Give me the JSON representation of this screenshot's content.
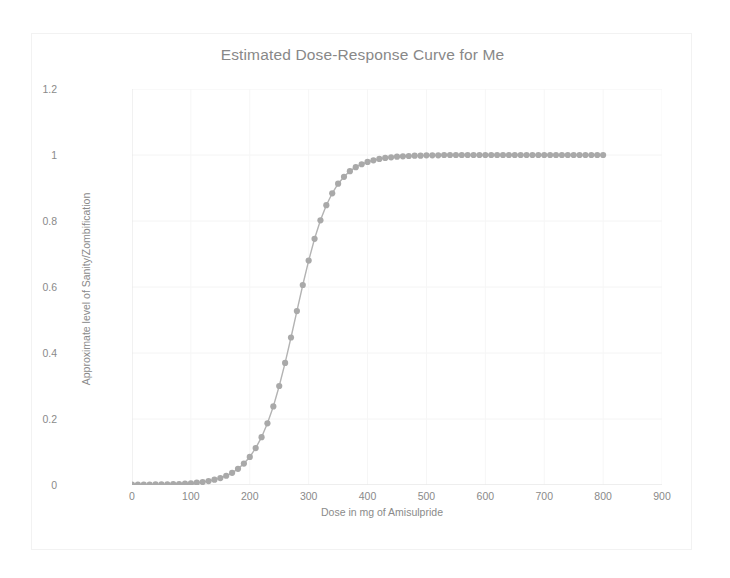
{
  "chart_data": {
    "type": "line",
    "title": "Estimated Dose-Response Curve for Me",
    "xlabel": "Dose in mg of Amisulpride",
    "ylabel": "Approximate level of Sanity/Zombification",
    "xlim": [
      0,
      900
    ],
    "ylim": [
      0,
      1.2
    ],
    "xticks": [
      0,
      100,
      200,
      300,
      400,
      500,
      600,
      700,
      800,
      900
    ],
    "yticks": [
      0,
      0.2,
      0.4,
      0.6,
      0.8,
      1,
      1.2
    ],
    "ytick_labels": [
      "0",
      "0.2",
      "0.4",
      "0.6",
      "0.8",
      "1",
      "1.2"
    ],
    "xtick_labels": [
      "0",
      "100",
      "200",
      "300",
      "400",
      "500",
      "600",
      "700",
      "800",
      "900"
    ],
    "grid": true,
    "legend": null,
    "marker": "circle",
    "series_color": "#a9a9a9",
    "line_color": "#b3b3b3",
    "series": [
      {
        "name": "Estimated dose-response",
        "x": [
          0,
          10,
          20,
          30,
          40,
          50,
          60,
          70,
          80,
          90,
          100,
          110,
          120,
          130,
          140,
          150,
          160,
          170,
          180,
          190,
          200,
          210,
          220,
          230,
          240,
          250,
          260,
          270,
          280,
          290,
          300,
          310,
          320,
          330,
          340,
          350,
          360,
          370,
          380,
          390,
          400,
          410,
          420,
          430,
          440,
          450,
          460,
          470,
          480,
          490,
          500,
          510,
          520,
          530,
          540,
          550,
          560,
          570,
          580,
          590,
          600,
          610,
          620,
          630,
          640,
          650,
          660,
          670,
          680,
          690,
          700,
          710,
          720,
          730,
          740,
          750,
          760,
          770,
          780,
          790,
          800
        ],
        "y": [
          0.001,
          0.001,
          0.001,
          0.001,
          0.002,
          0.002,
          0.002,
          0.003,
          0.003,
          0.004,
          0.005,
          0.007,
          0.009,
          0.012,
          0.016,
          0.021,
          0.028,
          0.037,
          0.049,
          0.065,
          0.085,
          0.112,
          0.145,
          0.187,
          0.238,
          0.3,
          0.37,
          0.447,
          0.527,
          0.606,
          0.68,
          0.746,
          0.802,
          0.848,
          0.884,
          0.913,
          0.934,
          0.951,
          0.963,
          0.972,
          0.979,
          0.984,
          0.988,
          0.991,
          0.993,
          0.995,
          0.996,
          0.997,
          0.998,
          0.998,
          0.999,
          0.999,
          0.999,
          1,
          1,
          1,
          1,
          1,
          1,
          1,
          1,
          1,
          1,
          1,
          1,
          1,
          1,
          1,
          1,
          1,
          1,
          1,
          1,
          1,
          1,
          1,
          1,
          1,
          1,
          1,
          1
        ]
      }
    ]
  }
}
